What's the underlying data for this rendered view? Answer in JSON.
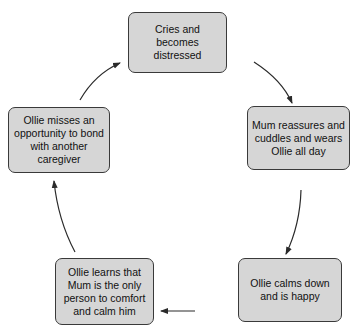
{
  "diagram": {
    "type": "cycle",
    "colors": {
      "box_fill": "#d6d6d6",
      "box_border": "#3a3a3a",
      "arrow": "#2a2a2a",
      "text": "#111111"
    },
    "nodes": [
      {
        "id": "n1",
        "label": "Cries and becomes distressed"
      },
      {
        "id": "n2",
        "label": "Mum reassures and cuddles and wears Ollie all day"
      },
      {
        "id": "n3",
        "label": "Ollie calms down and is happy"
      },
      {
        "id": "n4",
        "label": "Ollie learns that Mum is the only person to comfort and calm him"
      },
      {
        "id": "n5",
        "label": "Ollie misses an opportunity to bond with another caregiver"
      }
    ],
    "edges": [
      {
        "from": "n1",
        "to": "n2"
      },
      {
        "from": "n2",
        "to": "n3"
      },
      {
        "from": "n3",
        "to": "n4"
      },
      {
        "from": "n4",
        "to": "n5"
      },
      {
        "from": "n5",
        "to": "n1"
      }
    ]
  }
}
